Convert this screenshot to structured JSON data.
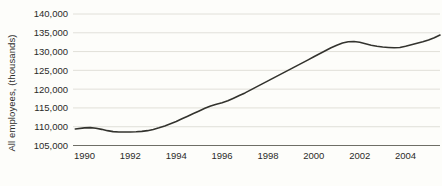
{
  "chart_data": {
    "type": "line",
    "title": "",
    "subtitle": "",
    "xlabel": "",
    "ylabel": "All employees, (thousands)",
    "xlim": [
      1989.5,
      2005.5
    ],
    "ylim": [
      105000,
      140000
    ],
    "grid": true,
    "legend": false,
    "legend_position": "none",
    "y_ticks": [
      105000,
      110000,
      115000,
      120000,
      125000,
      130000,
      135000,
      140000
    ],
    "y_tick_labels": [
      "105,000",
      "110,000",
      "115,000",
      "120,000",
      "125,000",
      "130,000",
      "135,000",
      "140,000"
    ],
    "x_ticks": [
      1990,
      1992,
      1994,
      1996,
      1998,
      2000,
      2002,
      2004
    ],
    "x_tick_labels": [
      "1990",
      "1992",
      "1994",
      "1996",
      "1998",
      "2000",
      "2002",
      "2004"
    ],
    "line_color": "#33332e",
    "grid_color": "#d9d8d0",
    "axis_color": "#6e6e66",
    "background_color": "#fdfdfa",
    "series": [
      {
        "name": "All employees",
        "x": [
          1989.6,
          1990.0,
          1990.25,
          1990.5,
          1990.75,
          1991.0,
          1991.25,
          1991.5,
          1991.75,
          1992.0,
          1992.25,
          1992.5,
          1992.75,
          1993.0,
          1993.25,
          1993.5,
          1993.75,
          1994.0,
          1994.25,
          1994.5,
          1994.75,
          1995.0,
          1995.25,
          1995.5,
          1995.75,
          1996.0,
          1996.25,
          1996.5,
          1996.75,
          1997.0,
          1997.25,
          1997.5,
          1997.75,
          1998.0,
          1998.25,
          1998.5,
          1998.75,
          1999.0,
          1999.25,
          1999.5,
          1999.75,
          2000.0,
          2000.25,
          2000.5,
          2000.75,
          2001.0,
          2001.25,
          2001.5,
          2001.75,
          2002.0,
          2002.25,
          2002.5,
          2002.75,
          2003.0,
          2003.25,
          2003.5,
          2003.75,
          2004.0,
          2004.25,
          2004.5,
          2004.75,
          2005.0,
          2005.25,
          2005.5
        ],
        "values": [
          109400,
          109700,
          109750,
          109600,
          109300,
          108950,
          108700,
          108600,
          108600,
          108600,
          108650,
          108750,
          108950,
          109250,
          109700,
          110200,
          110800,
          111400,
          112100,
          112800,
          113500,
          114200,
          114900,
          115500,
          116000,
          116400,
          116900,
          117600,
          118300,
          119000,
          119800,
          120600,
          121400,
          122200,
          123000,
          123800,
          124600,
          125400,
          126200,
          127000,
          127800,
          128600,
          129400,
          130200,
          131000,
          131700,
          132300,
          132600,
          132700,
          132500,
          132100,
          131700,
          131400,
          131200,
          131100,
          131000,
          131100,
          131400,
          131800,
          132200,
          132600,
          133100,
          133700,
          134400
        ]
      }
    ]
  }
}
